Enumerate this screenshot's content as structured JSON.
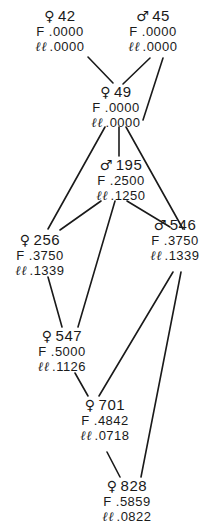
{
  "diagram": {
    "type": "pedigree",
    "labels": {
      "f": "F",
      "ll": "ℓℓ"
    },
    "sex_symbols": {
      "female": "♀",
      "male": "♂"
    },
    "nodes": [
      {
        "id": "42",
        "sex": "female",
        "symbol": "♀",
        "F": ".0000",
        "ll": ".0000",
        "x": 60,
        "y": 8
      },
      {
        "id": "45",
        "sex": "male",
        "symbol": "♂",
        "F": ".0000",
        "ll": ".0000",
        "x": 153,
        "y": 8
      },
      {
        "id": "49",
        "sex": "female",
        "symbol": "♀",
        "F": ".0000",
        "ll": ".0000",
        "x": 116,
        "y": 84
      },
      {
        "id": "195",
        "sex": "male",
        "symbol": "♂",
        "F": ".2500",
        "ll": ".1250",
        "x": 121,
        "y": 157
      },
      {
        "id": "256",
        "sex": "female",
        "symbol": "♀",
        "F": ".3750",
        "ll": ".1339",
        "x": 40,
        "y": 232
      },
      {
        "id": "546",
        "sex": "male",
        "symbol": "♂",
        "F": ".3750",
        "ll": ".1339",
        "x": 175,
        "y": 217
      },
      {
        "id": "547",
        "sex": "female",
        "symbol": "♀",
        "F": ".5000",
        "ll": ".1126",
        "x": 62,
        "y": 328
      },
      {
        "id": "701",
        "sex": "female",
        "symbol": "♀",
        "F": ".4842",
        "ll": ".0718",
        "x": 105,
        "y": 397
      },
      {
        "id": "828",
        "sex": "female",
        "symbol": "♀",
        "F": ".5859",
        "ll": ".0822",
        "x": 127,
        "y": 478
      }
    ],
    "edges": [
      {
        "from": "42",
        "to": "49",
        "x1": 88,
        "y1": 57,
        "x2": 113,
        "y2": 83
      },
      {
        "from": "45",
        "to": "49",
        "x1": 150,
        "y1": 58,
        "x2": 123,
        "y2": 84
      },
      {
        "from": "45",
        "to": "195",
        "x1": 163,
        "y1": 58,
        "x2": 143,
        "y2": 120
      },
      {
        "from": "49",
        "to": "256",
        "x1": 105,
        "y1": 127,
        "x2": 48,
        "y2": 229
      },
      {
        "from": "49",
        "to": "195",
        "x1": 119,
        "y1": 127,
        "x2": 119,
        "y2": 156
      },
      {
        "from": "49",
        "to": "546",
        "x1": 126,
        "y1": 127,
        "x2": 183,
        "y2": 229
      },
      {
        "from": "195",
        "to": "256",
        "x1": 101,
        "y1": 201,
        "x2": 60,
        "y2": 230
      },
      {
        "from": "195",
        "to": "547",
        "x1": 115,
        "y1": 201,
        "x2": 78,
        "y2": 327
      },
      {
        "from": "195",
        "to": "546",
        "x1": 127,
        "y1": 201,
        "x2": 170,
        "y2": 227
      },
      {
        "from": "256",
        "to": "547",
        "x1": 48,
        "y1": 277,
        "x2": 62,
        "y2": 327
      },
      {
        "from": "546",
        "to": "701",
        "x1": 173,
        "y1": 272,
        "x2": 99,
        "y2": 396
      },
      {
        "from": "546",
        "to": "828",
        "x1": 181,
        "y1": 272,
        "x2": 141,
        "y2": 477
      },
      {
        "from": "547",
        "to": "701",
        "x1": 75,
        "y1": 373,
        "x2": 88,
        "y2": 396
      },
      {
        "from": "701",
        "to": "828",
        "x1": 107,
        "y1": 452,
        "x2": 120,
        "y2": 477
      }
    ],
    "line_color": "#1a1a1a",
    "background": "#ffffff"
  }
}
